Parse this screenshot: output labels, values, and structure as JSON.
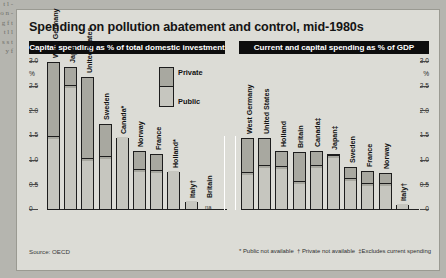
{
  "gutter_text": "t l - o n - g f t t l l s s t y f",
  "figure": {
    "title": "Spending on pollution abatement and control, mid-1980s",
    "source": "Source: OECD",
    "legend": {
      "private": "Private",
      "public": "Public"
    },
    "footnotes": [
      "* Public not available",
      "† Private not available",
      "‡Excludes current spending"
    ]
  },
  "chart_data": [
    {
      "type": "bar",
      "title": "Capital spending as % of total domestic investment",
      "subtype": "stacked",
      "xlabel": "",
      "ylabel": "%",
      "ylim": [
        0,
        3.0
      ],
      "yticks": [
        "3.0",
        "%",
        "2.5",
        "2.0",
        "1.5",
        "1.0",
        "0.5",
        "0"
      ],
      "ytick_values": [
        3.0,
        2.75,
        2.5,
        2.0,
        1.5,
        1.0,
        0.5,
        0
      ],
      "grid": false,
      "legend_position": "top-right",
      "series": [
        {
          "name": "Public",
          "values": [
            1.45,
            2.5,
            1.02,
            1.05,
            1.45,
            0.8,
            0.78,
            0.78,
            0.17,
            null
          ]
        },
        {
          "name": "Private",
          "values": [
            1.55,
            0.4,
            1.68,
            0.7,
            0.0,
            0.4,
            0.35,
            0.0,
            0.0,
            null
          ]
        }
      ],
      "categories": [
        "West Germany",
        "Japan",
        "United States",
        "Sweden",
        "Canada*",
        "Norway",
        "France",
        "Holland*",
        "Italy†",
        "Britain"
      ],
      "totals": [
        3.0,
        2.9,
        2.7,
        1.75,
        1.45,
        1.2,
        1.13,
        0.78,
        0.17,
        null
      ],
      "notes": {
        "Britain": "na"
      }
    },
    {
      "type": "bar",
      "title": "Current and capital spending as % of GDP",
      "subtype": "stacked",
      "xlabel": "",
      "ylabel": "%",
      "ylim": [
        0,
        3.0
      ],
      "yticks": [
        "3.0",
        "%",
        "2.5",
        "2.0",
        "1.5",
        "1.0",
        "0.5",
        "0"
      ],
      "ytick_values": [
        3.0,
        2.75,
        2.5,
        2.0,
        1.5,
        1.0,
        0.5,
        0
      ],
      "grid": false,
      "legend_position": "none",
      "series": [
        {
          "name": "Public",
          "values": [
            0.72,
            0.88,
            0.85,
            0.55,
            0.88,
            1.08,
            0.6,
            0.5,
            0.5,
            0.1
          ]
        },
        {
          "name": "Private",
          "values": [
            0.73,
            0.57,
            0.35,
            0.63,
            0.32,
            0.05,
            0.27,
            0.3,
            0.25,
            0.0
          ]
        }
      ],
      "categories": [
        "West Germany",
        "United States",
        "Holland",
        "Britain",
        "Canada‡",
        "Japan‡",
        "Sweden",
        "France",
        "Norway",
        "Italy†"
      ],
      "totals": [
        1.45,
        1.45,
        1.2,
        1.18,
        1.2,
        1.13,
        0.87,
        0.8,
        0.75,
        0.1
      ]
    }
  ]
}
